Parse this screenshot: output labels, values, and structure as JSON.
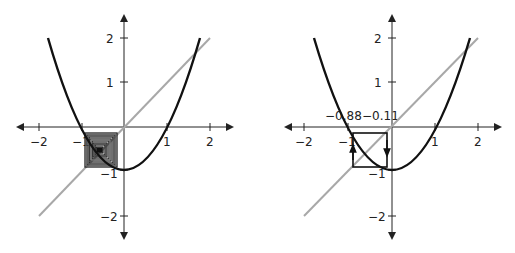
{
  "figure": {
    "function": "x^2 - 1",
    "diagonal": "y = x"
  },
  "left_panel": {
    "x_ticks": [
      "−2",
      "−1",
      "1",
      "2"
    ],
    "y_ticks": [
      "2",
      "1",
      "−1",
      "−2"
    ],
    "cobweb": "dense nested squares converging to period-2 orbit between 0 and -1"
  },
  "right_panel": {
    "x_ticks": [
      "−2",
      "−1",
      "1",
      "2"
    ],
    "y_ticks": [
      "2",
      "1",
      "−1",
      "−2"
    ],
    "annotations": [
      "−0.88",
      "−0.11"
    ],
    "cobweb": "single square cycle with arrows"
  },
  "colors": {
    "curve": "#111111",
    "diagonal": "#a8a8a8",
    "axis": "#222222"
  }
}
